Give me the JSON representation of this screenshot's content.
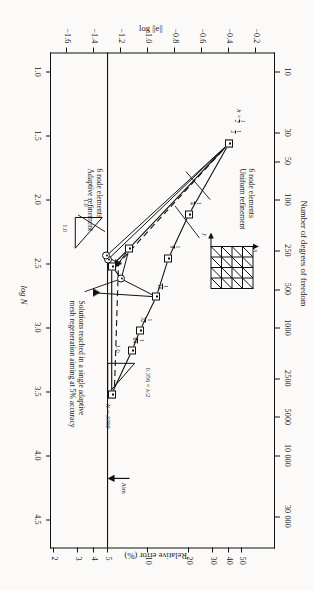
{
  "figure": {
    "left_axis_title": "Number of degrees of freedom",
    "bottom_axis_title": "log N",
    "top_axis_title": "Relative error (%)",
    "right_axis_title": "log ||e||"
  },
  "chart_data": {
    "type": "line",
    "xlabel": "log N",
    "ylabel": "log ||e||",
    "x2label": "Number of degrees of freedom",
    "y2label": "Relative error (%)",
    "xlim": [
      0.85,
      4.72
    ],
    "ylim": [
      -1.72,
      -0.06
    ],
    "grid": false,
    "xticks": [
      "1.0",
      "1.5",
      "2.0",
      "2.5",
      "3.0",
      "3.5",
      "4.0",
      "4.5"
    ],
    "xtickvals": [
      1.0,
      1.5,
      2.0,
      2.5,
      3.0,
      3.5,
      4.0,
      4.5
    ],
    "yticks": [
      "-0.2",
      "-0.4",
      "-0.6",
      "-0.8",
      "-1.0",
      "-1.2",
      "-1.4",
      "-1.6"
    ],
    "ytickvals": [
      -0.2,
      -0.4,
      -0.6,
      -0.8,
      -1.0,
      -1.2,
      -1.4,
      -1.6
    ],
    "x2ticks": [
      "10",
      "30",
      "50",
      "100",
      "250",
      "500",
      "1000",
      "2500",
      "5000",
      "10 000",
      "30 000"
    ],
    "x2tickvals": [
      1.0,
      1.477,
      1.699,
      2.0,
      2.398,
      2.699,
      3.0,
      3.398,
      3.699,
      4.0,
      4.477
    ],
    "y2ticks": [
      "50",
      "40",
      "30",
      "20",
      "10",
      "5",
      "4",
      "3",
      "2"
    ],
    "y2tickvals": [
      -0.301,
      -0.398,
      -0.523,
      -0.699,
      -1.0,
      -1.301,
      -1.398,
      -1.523,
      -1.699
    ],
    "aim_label": "Aim",
    "aim_value": "5",
    "series": [
      {
        "name": "6 node elements Uniform refinement",
        "marker": "square",
        "style": "solid",
        "points": [
          {
            "x": 1.56,
            "y": -0.4,
            "label": "1/2"
          },
          {
            "x": 2.12,
            "y": -0.7,
            "label": "1/4"
          },
          {
            "x": 2.46,
            "y": -0.85,
            "label": "1/8"
          },
          {
            "x": 2.76,
            "y": -0.94,
            "label": "1/16"
          },
          {
            "x": 3.02,
            "y": -1.06,
            "label": "1/32"
          },
          {
            "x": 3.18,
            "y": -1.12,
            "label": "1/64"
          },
          {
            "x": 3.52,
            "y": -1.27,
            "label": ""
          }
        ]
      },
      {
        "name": "6 node elements Adaptive refinement",
        "marker": "square",
        "style": "solid",
        "points": [
          {
            "x": 1.56,
            "y": -0.4,
            "label": ""
          },
          {
            "x": 2.38,
            "y": -1.14,
            "label": ""
          },
          {
            "x": 2.52,
            "y": -1.27,
            "label": ""
          },
          {
            "x": 3.52,
            "y": -1.27,
            "label": ""
          }
        ]
      },
      {
        "name": "Adaptive dashed path",
        "marker": "none",
        "style": "dashed",
        "points": [
          {
            "x": 1.56,
            "y": -0.4,
            "label": ""
          },
          {
            "x": 2.5,
            "y": -1.22,
            "label": ""
          },
          {
            "x": 3.5,
            "y": -1.25,
            "label": ""
          }
        ]
      },
      {
        "name": "Single adaptive mesh regeneration solutions",
        "marker": "circle",
        "style": "solid",
        "points": [
          {
            "x": 2.62,
            "y": -1.2,
            "label": ""
          },
          {
            "x": 2.47,
            "y": -1.3,
            "label": ""
          },
          {
            "x": 2.44,
            "y": -1.31,
            "label": ""
          }
        ]
      },
      {
        "name": "Triangle markers",
        "marker": "triangle",
        "style": "none",
        "points": [
          {
            "x": 2.73,
            "y": -1.38,
            "label": ""
          },
          {
            "x": 2.5,
            "y": -1.22,
            "label": ""
          }
        ]
      }
    ],
    "annotations": [
      {
        "id": "uniform-label",
        "text": "6 node elements\nUniform refinement"
      },
      {
        "id": "adaptive-label",
        "text": "6 node elements\nAdaptive refinement"
      },
      {
        "id": "solutions-label",
        "text": "Solutions reached in a single adaptive\nmesh regeneration aiming at 5% accuracy"
      },
      {
        "id": "lambda-label",
        "text": "0.356 = λ/2"
      },
      {
        "id": "n-label",
        "text": "N = 3360"
      },
      {
        "id": "h-label-num",
        "text": "1"
      },
      {
        "id": "h-label-den",
        "text": "2"
      },
      {
        "id": "h-label-lhs",
        "text": "h ="
      },
      {
        "id": "slope-top-rise",
        "text": "1.0"
      },
      {
        "id": "slope-top-run",
        "text": "1.0"
      },
      {
        "id": "slope-bot-rise",
        "text": "1.0"
      },
      {
        "id": "slope-bot-run",
        "text": "1.0"
      },
      {
        "id": "mesh-x-axis",
        "text": "x"
      },
      {
        "id": "mesh-y-axis",
        "text": "y"
      }
    ]
  }
}
